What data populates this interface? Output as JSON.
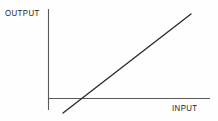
{
  "figure": {
    "name": "input-output-linear-graph",
    "background_color": "#fefefe",
    "line_color": "#2b2b2b",
    "axis_color": "#5a5a5a",
    "text_color": "#1d1d1d",
    "y_axis_label": "OUTPUT",
    "x_axis_label": "INPUT"
  },
  "chart_data": {
    "type": "line",
    "title": "",
    "xlabel": "INPUT",
    "ylabel": "OUTPUT",
    "grid": false,
    "legend": false,
    "axes_style": "origin-crossed",
    "xlim": [
      0,
      100
    ],
    "ylim": [
      -20,
      100
    ],
    "tick_labels": {
      "x": [],
      "y": []
    },
    "series": [
      {
        "name": "output vs input",
        "x": [
          10,
          100
        ],
        "y": [
          -15,
          85
        ],
        "x_intercept": 23,
        "slope": 1.11,
        "comment": "straight increasing line crossing the x-axis"
      }
    ]
  },
  "geometry": {
    "y_axis": {
      "x": 48,
      "y_top": 9,
      "y_bottom": 110
    },
    "x_axis": {
      "y": 98,
      "x_left": 48,
      "x_right": 210
    },
    "data_line": {
      "x1": 63,
      "y1": 113,
      "x2": 191,
      "y2": 14
    },
    "x_intercept_px": 75
  }
}
